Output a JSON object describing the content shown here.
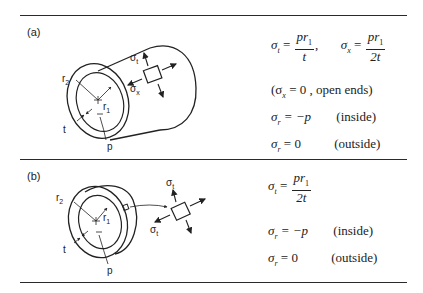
{
  "panels": [
    {
      "label": "(a)",
      "description": "thin-walled cylinder",
      "figure_labels": {
        "r2": "r",
        "r2_sub": "2",
        "r1": "r",
        "r1_sub": "1",
        "t": "t",
        "p": "p",
        "sigma_t": "σ",
        "sigma_t_sub": "t",
        "sigma_x": "σ",
        "sigma_x_sub": "x"
      },
      "equations": {
        "eq1_lhs": "σ",
        "eq1_lhs_sub": "t",
        "eq1_eq": "=",
        "eq1_num": "pr",
        "eq1_num_sub": "1",
        "eq1_den": "t",
        "eq1_sep": ",",
        "eq2_lhs": "σ",
        "eq2_lhs_sub": "x",
        "eq2_eq": "=",
        "eq2_num": "pr",
        "eq2_num_sub": "1",
        "eq2_den": "2t",
        "eq3_open": "(σ",
        "eq3_sub": "x",
        "eq3_rest": " = 0 ,  open ends)",
        "eq4_lhs": "σ",
        "eq4_sub": "r",
        "eq4_rhs": " = −p",
        "eq4_note": "(inside)",
        "eq5_lhs": "σ",
        "eq5_sub": "r",
        "eq5_rhs": " = 0",
        "eq5_note": "(outside)"
      }
    },
    {
      "label": "(b)",
      "description": "thin ring",
      "figure_labels": {
        "r2": "r",
        "r2_sub": "2",
        "r1": "r",
        "r1_sub": "1",
        "t": "t",
        "p": "p",
        "sigma_t_top": "σ",
        "sigma_t_top_sub": "t",
        "sigma_t_left": "σ",
        "sigma_t_left_sub": "t"
      },
      "equations": {
        "eq1_lhs": "σ",
        "eq1_lhs_sub": "t",
        "eq1_eq": "=",
        "eq1_num": "pr",
        "eq1_num_sub": "1",
        "eq1_den": "2t",
        "eq2_lhs": "σ",
        "eq2_sub": "r",
        "eq2_rhs": " = −p",
        "eq2_note": "(inside)",
        "eq3_lhs": "σ",
        "eq3_sub": "r",
        "eq3_rhs": " = 0",
        "eq3_note": "(outside)"
      }
    }
  ],
  "colors": {
    "ink": "#222222",
    "background": "#ffffff",
    "rule": "#2a2a2a"
  }
}
